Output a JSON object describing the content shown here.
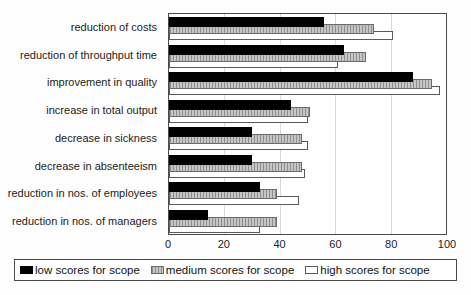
{
  "chart_data": {
    "type": "bar",
    "orientation": "horizontal",
    "title": "",
    "xlabel": "",
    "ylabel": "",
    "xlim": [
      0,
      100
    ],
    "xticks": [
      0,
      20,
      40,
      60,
      80,
      100
    ],
    "grid": "vertical-light-gray",
    "legend_position": "bottom",
    "categories": [
      "reduction of costs",
      "reduction of throughput time",
      "improvement in quality",
      "increase in total output",
      "decrease in sickness",
      "decrease in absenteeism",
      "reduction in nos. of employees",
      "reduction in nos. of managers"
    ],
    "series": [
      {
        "key": "low",
        "name": "low scores for scope",
        "color": "#000000",
        "pattern": "solid",
        "values": [
          56,
          63,
          88,
          44,
          30,
          30,
          33,
          14
        ]
      },
      {
        "key": "medium",
        "name": "medium scores for scope",
        "color": "#b8b8b8",
        "pattern": "vertical-hatch",
        "values": [
          74,
          71,
          95,
          51,
          48,
          48,
          39,
          39
        ]
      },
      {
        "key": "high",
        "name": "high scores for scope",
        "color": "#ffffff",
        "pattern": "outline",
        "values": [
          81,
          61,
          98,
          50,
          50,
          49,
          47,
          33
        ]
      }
    ]
  }
}
